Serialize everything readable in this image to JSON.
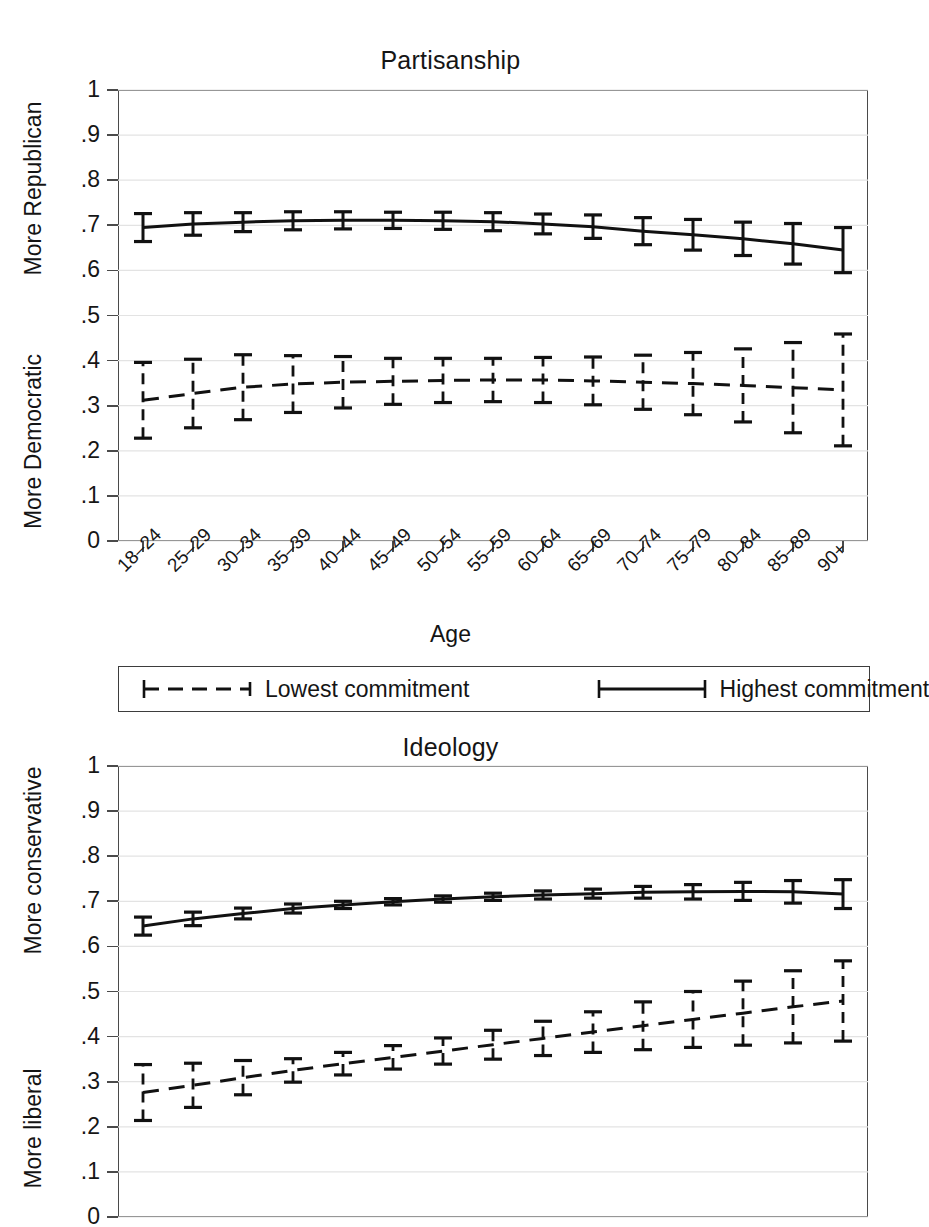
{
  "figure": {
    "x_axis_label": "Age",
    "categories": [
      "18–24",
      "25–29",
      "30–34",
      "35–39",
      "40–44",
      "45–49",
      "50–54",
      "55–59",
      "60–64",
      "65–69",
      "70–74",
      "75–79",
      "80–84",
      "85–89",
      "90+"
    ],
    "y_ticks": [
      "0",
      ".1",
      ".2",
      ".3",
      ".4",
      ".5",
      ".6",
      ".7",
      ".8",
      ".9",
      "1"
    ],
    "legend": {
      "items": [
        {
          "label": "Lowest commitment",
          "style": "dashed",
          "key": "dashed-capped-line"
        },
        {
          "label": "Highest commitment",
          "style": "solid",
          "key": "solid-capped-line"
        }
      ]
    },
    "line_color": "#111111"
  },
  "chart_data": [
    {
      "type": "line",
      "title": "Partisanship",
      "xlabel": "Age",
      "ylabel_top": "More Republican",
      "ylabel_bottom": "More Democratic",
      "ylim": [
        0,
        1
      ],
      "ytick_values": [
        0,
        0.1,
        0.2,
        0.3,
        0.4,
        0.5,
        0.6,
        0.7,
        0.8,
        0.9,
        1
      ],
      "grid": true,
      "legend_position": "below",
      "categories": [
        "18–24",
        "25–29",
        "30–34",
        "35–39",
        "40–44",
        "45–49",
        "50–54",
        "55–59",
        "60–64",
        "65–69",
        "70–74",
        "75–79",
        "80–84",
        "85–89",
        "90+"
      ],
      "series": [
        {
          "name": "Highest commitment",
          "style": "solid",
          "values": [
            0.695,
            0.703,
            0.707,
            0.71,
            0.711,
            0.711,
            0.71,
            0.708,
            0.703,
            0.697,
            0.687,
            0.679,
            0.67,
            0.659,
            0.645
          ],
          "ci_low": [
            0.664,
            0.678,
            0.686,
            0.69,
            0.692,
            0.693,
            0.691,
            0.688,
            0.681,
            0.671,
            0.657,
            0.645,
            0.633,
            0.614,
            0.595
          ],
          "ci_high": [
            0.726,
            0.728,
            0.728,
            0.73,
            0.73,
            0.729,
            0.729,
            0.728,
            0.725,
            0.723,
            0.717,
            0.713,
            0.707,
            0.704,
            0.695
          ]
        },
        {
          "name": "Lowest commitment",
          "style": "dashed",
          "values": [
            0.312,
            0.327,
            0.341,
            0.348,
            0.352,
            0.354,
            0.356,
            0.357,
            0.357,
            0.355,
            0.352,
            0.349,
            0.345,
            0.34,
            0.335
          ],
          "ci_low": [
            0.228,
            0.251,
            0.269,
            0.285,
            0.295,
            0.303,
            0.307,
            0.309,
            0.307,
            0.302,
            0.292,
            0.28,
            0.264,
            0.24,
            0.211
          ],
          "ci_high": [
            0.396,
            0.403,
            0.413,
            0.411,
            0.409,
            0.405,
            0.405,
            0.405,
            0.407,
            0.408,
            0.412,
            0.418,
            0.426,
            0.44,
            0.459
          ]
        }
      ]
    },
    {
      "type": "line",
      "title": "Ideology",
      "xlabel": "Age",
      "ylabel_top": "More conservative",
      "ylabel_bottom": "More liberal",
      "ylim": [
        0,
        1
      ],
      "ytick_values": [
        0,
        0.1,
        0.2,
        0.3,
        0.4,
        0.5,
        0.6,
        0.7,
        0.8,
        0.9,
        1
      ],
      "grid": true,
      "legend_position": "shared-above",
      "categories": [
        "18–24",
        "25–29",
        "30–34",
        "35–39",
        "40–44",
        "45–49",
        "50–54",
        "55–59",
        "60–64",
        "65–69",
        "70–74",
        "75–79",
        "80–84",
        "85–89",
        "90+"
      ],
      "series": [
        {
          "name": "Highest commitment",
          "style": "solid",
          "values": [
            0.645,
            0.661,
            0.673,
            0.684,
            0.692,
            0.699,
            0.705,
            0.71,
            0.714,
            0.717,
            0.72,
            0.721,
            0.722,
            0.721,
            0.716
          ],
          "ci_low": [
            0.625,
            0.646,
            0.661,
            0.674,
            0.684,
            0.692,
            0.698,
            0.702,
            0.705,
            0.707,
            0.707,
            0.705,
            0.702,
            0.696,
            0.684
          ],
          "ci_high": [
            0.665,
            0.676,
            0.685,
            0.694,
            0.7,
            0.706,
            0.712,
            0.718,
            0.723,
            0.727,
            0.733,
            0.737,
            0.742,
            0.746,
            0.748
          ]
        },
        {
          "name": "Lowest commitment",
          "style": "dashed",
          "values": [
            0.276,
            0.292,
            0.309,
            0.325,
            0.34,
            0.354,
            0.368,
            0.382,
            0.396,
            0.41,
            0.424,
            0.438,
            0.452,
            0.466,
            0.479
          ],
          "ci_low": [
            0.214,
            0.243,
            0.271,
            0.299,
            0.315,
            0.328,
            0.339,
            0.35,
            0.358,
            0.365,
            0.371,
            0.376,
            0.381,
            0.386,
            0.39
          ],
          "ci_high": [
            0.338,
            0.341,
            0.347,
            0.351,
            0.365,
            0.38,
            0.397,
            0.414,
            0.434,
            0.455,
            0.477,
            0.5,
            0.523,
            0.546,
            0.568
          ]
        }
      ]
    }
  ]
}
